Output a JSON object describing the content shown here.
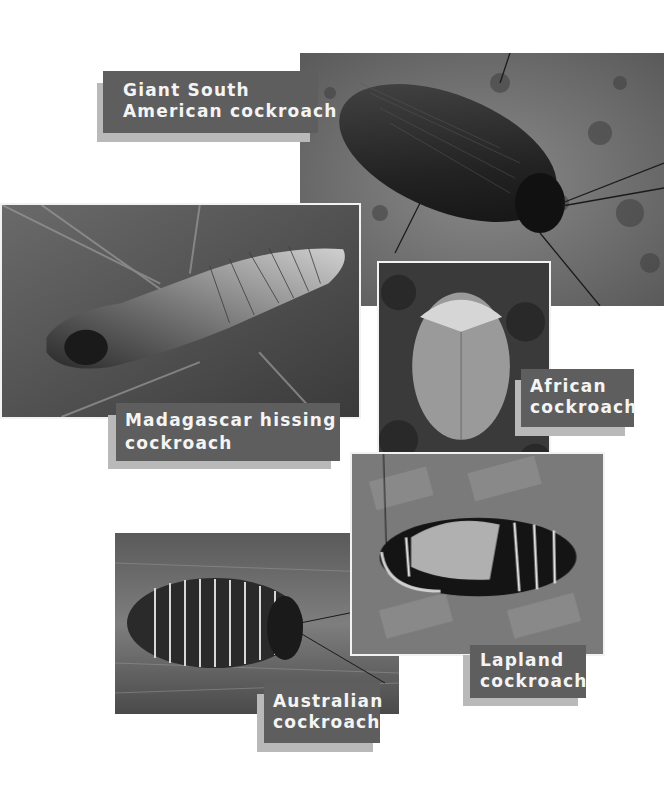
{
  "page": {
    "background": "#ffffff",
    "label_color": "#5e5e5e",
    "label_shadow_color": "#b9b9b9",
    "label_text_color": "#f4f4f4"
  },
  "photos": [
    {
      "id": "giant-south-american",
      "subject": "Giant South American cockroach on bark"
    },
    {
      "id": "madagascar-hissing",
      "subject": "Madagascar hissing cockroach on leaf"
    },
    {
      "id": "african",
      "subject": "African cockroach on forest floor"
    },
    {
      "id": "lapland",
      "subject": "Lapland cockroach on leaf"
    },
    {
      "id": "australian",
      "subject": "Australian cockroach on wood"
    }
  ],
  "labels": {
    "giant": {
      "line1": "Giant South",
      "line2": "American cockroach"
    },
    "madagascar": {
      "line1": "Madagascar hissing",
      "line2": "cockroach"
    },
    "african": {
      "line1": "African",
      "line2": "cockroach"
    },
    "lapland": {
      "line1": "Lapland",
      "line2": "cockroach"
    },
    "australian": {
      "line1": "Australian",
      "line2": "cockroach"
    }
  }
}
